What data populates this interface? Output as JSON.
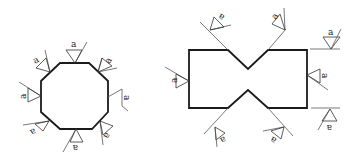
{
  "diagram": {
    "type": "weld-symbol-drawing",
    "weld_label": "a",
    "colors": {
      "outline": "#1a1a1a",
      "leader": "#555555",
      "background": "#ffffff"
    },
    "figures": [
      {
        "name": "octagon-section",
        "shape": "octagon",
        "weld_symbol_count": 8,
        "labels": [
          "a",
          "a",
          "a",
          "a",
          "a",
          "a",
          "a",
          "a"
        ]
      },
      {
        "name": "notched-rectangle-section",
        "shape": "rectangle-with-v-notches",
        "weld_symbol_count": 7,
        "labels": [
          "a",
          "a",
          "a",
          "a",
          "a",
          "a",
          "a"
        ]
      }
    ]
  }
}
